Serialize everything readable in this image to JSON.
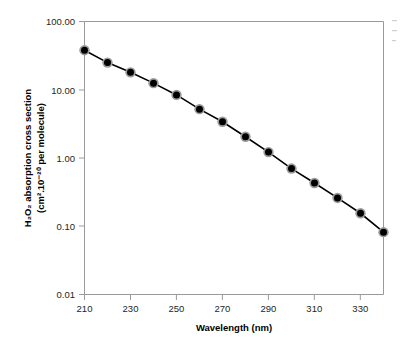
{
  "chart_data": {
    "type": "line",
    "title": "",
    "subtitle": "",
    "xlabel": "Wavelength (nm)",
    "ylabel_line1": "H₂O₂ absorption cross section",
    "ylabel_line2": "(cm².10⁻²⁰ per molecule)",
    "yscale": "log",
    "xscale": "linear",
    "xlim": [
      210,
      340
    ],
    "ylim": [
      0.01,
      100.0
    ],
    "grid": false,
    "legend": "none",
    "x_tick_labels": [
      "210",
      "230",
      "250",
      "270",
      "290",
      "310",
      "330"
    ],
    "x_tick_values": [
      210,
      230,
      250,
      270,
      290,
      310,
      330
    ],
    "x_minor_tick_values": [
      220,
      240,
      260,
      280,
      300,
      320,
      340
    ],
    "y_tick_labels": [
      "100.00",
      "10.00",
      "1.00",
      "0.10",
      "0.01"
    ],
    "y_tick_values": [
      100.0,
      10.0,
      1.0,
      0.1,
      0.01
    ],
    "x": [
      210,
      220,
      230,
      240,
      250,
      260,
      270,
      280,
      290,
      300,
      310,
      320,
      330,
      340
    ],
    "values": [
      38.0,
      25.0,
      18.0,
      12.5,
      8.4,
      5.2,
      3.4,
      2.05,
      1.22,
      0.7,
      0.43,
      0.26,
      0.155,
      0.082
    ],
    "series": [
      {
        "name": "H2O2 absorption cross section",
        "marker": "circle",
        "marker_face_color": "#000000",
        "marker_edge_color": "#9a9a9a",
        "line_color": "#000000",
        "values": [
          38.0,
          25.0,
          18.0,
          12.5,
          8.4,
          5.2,
          3.4,
          2.05,
          1.22,
          0.7,
          0.43,
          0.26,
          0.155,
          0.082
        ]
      }
    ],
    "colors": {
      "line": "#000000",
      "marker_core": "#000000",
      "marker_ring": "#9a9a9a",
      "axis": "#9a9a9a",
      "text": "#231f20",
      "background": "#ffffff"
    }
  }
}
